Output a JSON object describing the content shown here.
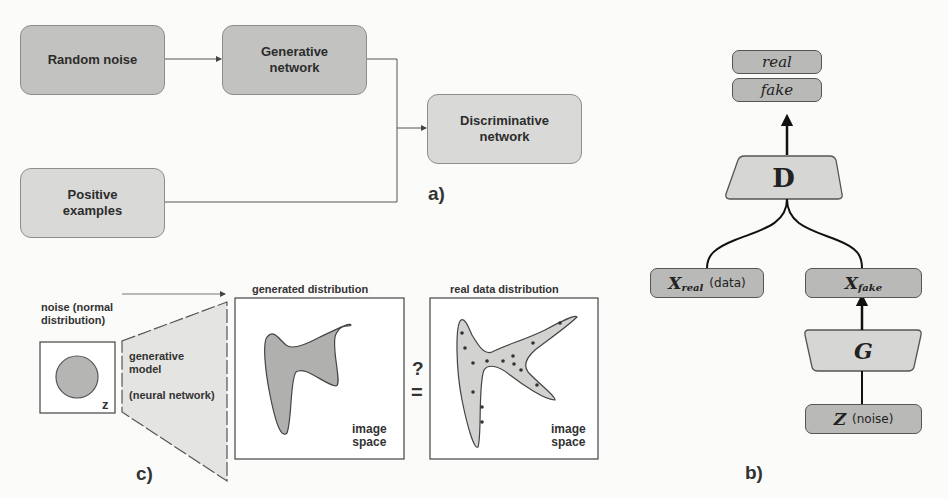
{
  "panel_a": {
    "label": "a)",
    "nodes": {
      "random_noise": "Random noise",
      "generative_network": [
        "Generative",
        "network"
      ],
      "discriminative_network": [
        "Discriminative",
        "network"
      ],
      "positive_examples": [
        "Positive",
        "examples"
      ]
    },
    "edges": [
      [
        "Random noise",
        "Generative network"
      ],
      [
        "Generative network",
        "Discriminative network"
      ],
      [
        "Positive examples",
        "Discriminative network"
      ]
    ]
  },
  "panel_b": {
    "label": "b)",
    "outputs": {
      "real": "real",
      "fake": "fake"
    },
    "discriminator": "D",
    "generator": "G",
    "x_real": {
      "symbol": "X",
      "subscript": "real",
      "note": "(data)"
    },
    "x_fake": {
      "symbol": "X",
      "subscript": "fake"
    },
    "z": {
      "symbol": "Z",
      "note": "(noise)"
    }
  },
  "panel_c": {
    "label": "c)",
    "noise_label": [
      "noise (normal",
      "distribution)"
    ],
    "z_label": "z",
    "model_label": [
      "generative",
      "model"
    ],
    "model_sub": "(neural network)",
    "generated_title": "generated distribution",
    "real_title": "real data distribution",
    "space_label": [
      "image",
      "space"
    ],
    "question": "?",
    "equals": "="
  },
  "colors": {
    "dark_box": "#c2c2c0",
    "light_box": "#d9d9d7",
    "pill": "#b9b9b7",
    "shape_fill": "#b5b5b3",
    "line": "#333333"
  }
}
